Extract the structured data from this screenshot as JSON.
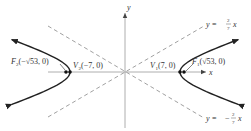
{
  "diagram": {
    "type": "hyperbola",
    "equation_params": {
      "a": 7,
      "b": 2,
      "c_squared": 53
    },
    "axes": {
      "x_label": "x",
      "y_label": "y"
    },
    "asymptotes": [
      {
        "id": "upper",
        "label_lhs": "y = ",
        "num": "2",
        "den": "7",
        "rhs": "x",
        "sign": ""
      },
      {
        "id": "lower",
        "label_lhs": "y = ",
        "num": "2",
        "den": "7",
        "rhs": "x",
        "sign": "−"
      }
    ],
    "points": {
      "V1": {
        "name": "V",
        "sub": "1",
        "coords": "(7, 0)"
      },
      "V2": {
        "name": "V",
        "sub": "2",
        "coords": "(−7, 0)"
      },
      "F1": {
        "name": "F",
        "sub": "1",
        "coords": "(√53, 0)"
      },
      "F2": {
        "name": "F",
        "sub": "2",
        "coords": "(−√53, 0)"
      }
    },
    "colors": {
      "curve": "#222222",
      "axis": "#999999",
      "asymptote": "#888888",
      "text": "#333333"
    }
  }
}
